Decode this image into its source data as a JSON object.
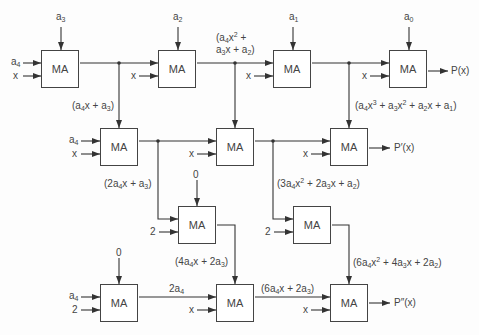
{
  "diagram": {
    "block_label": "MA",
    "row1": {
      "coeff_inputs": [
        "a3",
        "a2",
        "a1",
        "a0"
      ],
      "left_inputs": [
        "a4",
        "x"
      ],
      "x_label": "x",
      "output": "P(x)",
      "intermediates": [
        "(a4x + a3)",
        "(a4x^2 + a3x + a2)",
        "(a4x^3 + a3x^2 + a2x + a1)"
      ]
    },
    "row2": {
      "left_inputs": [
        "a4",
        "x"
      ],
      "x_label": "x",
      "output": "P'(x)",
      "intermediates": [
        "(2a4x + a3)",
        "(3a4x^2 + 2a3x + a2)"
      ]
    },
    "row3": {
      "top_input": "0",
      "side_input": "2",
      "intermediates": [
        "(4a4x + 2a3)",
        "(6a4x^2 + 4a3x + 2a2)"
      ]
    },
    "row4": {
      "top_input": "0",
      "left_inputs": [
        "a4",
        "2"
      ],
      "x_label": "x",
      "intermediates": [
        "2a4",
        "(6a4x + 2a3)"
      ],
      "output": "P''(x)"
    }
  },
  "text": {
    "a0": "a",
    "a0s": "0",
    "a1": "a",
    "a1s": "1",
    "a2": "a",
    "a2s": "2",
    "a3": "a",
    "a3s": "3",
    "a4": "a",
    "a4s": "4",
    "x": "x",
    "two": "2",
    "zero": "0",
    "P": "P(x)",
    "P1": "P′(x)",
    "P2": "P″(x)",
    "MA": "MA"
  }
}
